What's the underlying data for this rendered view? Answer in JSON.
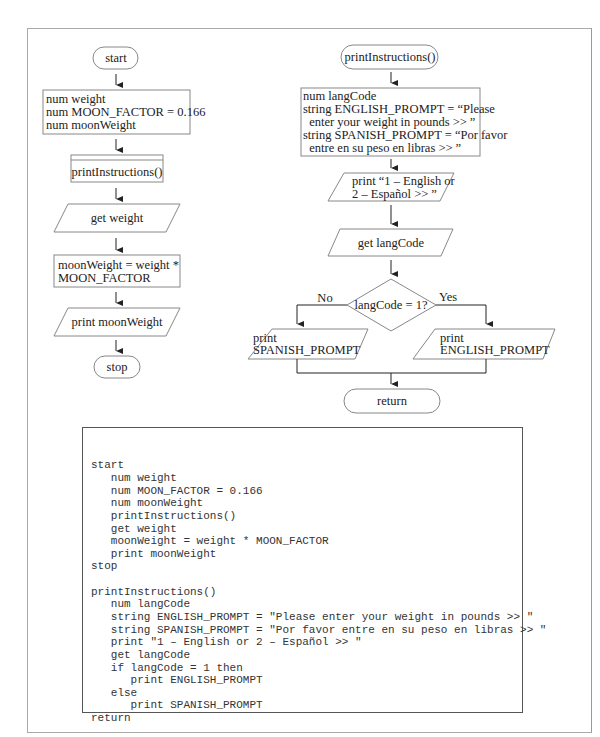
{
  "main_flowchart": {
    "start": "start",
    "declarations": [
      "num weight",
      "num MOON_FACTOR = 0.166",
      "num moonWeight"
    ],
    "call": "printInstructions()",
    "input": "get weight",
    "calc": [
      "moonWeight = weight *",
      "MOON_FACTOR"
    ],
    "output": "print moonWeight",
    "stop": "stop"
  },
  "sub_flowchart": {
    "start": "printInstructions()",
    "declarations": [
      "num langCode",
      "string ENGLISH_PROMPT = “Please",
      "  enter your weight in pounds >> ”",
      "string SPANISH_PROMPT = “Por favor",
      "  entre en su peso en libras >> ”"
    ],
    "menu": [
      "print “1 – English or",
      "2 – Español >> ”"
    ],
    "input": "get langCode",
    "decision": "langCode = 1?",
    "no_label": "No",
    "yes_label": "Yes",
    "no_branch": [
      "print",
      "SPANISH_PROMPT"
    ],
    "yes_branch": [
      "print",
      "ENGLISH_PROMPT"
    ],
    "end": "return"
  },
  "pseudocode": [
    "start",
    "   num weight",
    "   num MOON_FACTOR = 0.166",
    "   num moonWeight",
    "   printInstructions()",
    "   get weight",
    "   moonWeight = weight * MOON_FACTOR",
    "   print moonWeight",
    "stop",
    "",
    "printInstructions()",
    "   num langCode",
    "   string ENGLISH_PROMPT = \"Please enter your weight in pounds >> \"",
    "   string SPANISH_PROMPT = \"Por favor entre en su peso en libras >> \"",
    "   print \"1 – English or 2 – Español >> \"",
    "   get langCode",
    "   if langCode = 1 then",
    "      print ENGLISH_PROMPT",
    "   else",
    "      print SPANISH_PROMPT",
    "return"
  ]
}
